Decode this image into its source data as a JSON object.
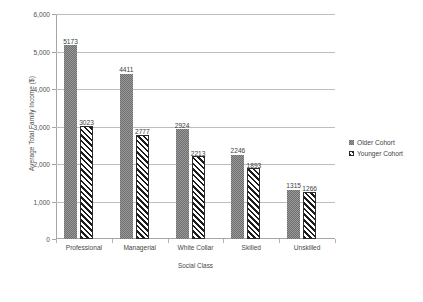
{
  "chart_data": {
    "type": "bar",
    "title": "",
    "xlabel": "Social Class",
    "ylabel": "Average Total Family Income ($)",
    "categories": [
      "Professional",
      "Managerial",
      "White Collar",
      "Skilled",
      "Unskilled"
    ],
    "series": [
      {
        "name": "Older Cohort",
        "values": [
          5173,
          4411,
          2924,
          2246,
          1315
        ]
      },
      {
        "name": "Younger Cohort",
        "values": [
          3023,
          2777,
          2213,
          1893,
          1266
        ]
      }
    ],
    "ylim": [
      0,
      6000
    ],
    "yticks": [
      0,
      1000,
      2000,
      3000,
      4000,
      5000,
      6000
    ],
    "ytick_labels": [
      "0",
      "1,000",
      "2,000",
      "3,000",
      "4,000",
      "5,000",
      "6,000"
    ],
    "grid": true,
    "legend_position": "right",
    "data_labels": true
  },
  "legend": {
    "entries": [
      {
        "label": "Older Cohort",
        "pattern": "solid-gray"
      },
      {
        "label": "Younger Cohort",
        "pattern": "diagonal-hatch"
      }
    ]
  }
}
